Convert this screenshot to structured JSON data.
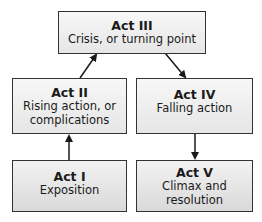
{
  "diagram": {
    "type": "flow",
    "nodes": [
      {
        "id": "act3",
        "title": "Act III",
        "desc": "Crisis, or turning point"
      },
      {
        "id": "act2",
        "title": "Act II",
        "desc": "Rising action, or complications"
      },
      {
        "id": "act4",
        "title": "Act IV",
        "desc": "Falling action"
      },
      {
        "id": "act1",
        "title": "Act I",
        "desc": "Exposition"
      },
      {
        "id": "act5",
        "title": "Act V",
        "desc": "Climax and resolution"
      }
    ],
    "edges": [
      {
        "from": "act1",
        "to": "act2"
      },
      {
        "from": "act2",
        "to": "act3"
      },
      {
        "from": "act3",
        "to": "act4"
      },
      {
        "from": "act4",
        "to": "act5"
      }
    ],
    "colors": {
      "border": "#333333",
      "fill_top": "#f2f2f2",
      "fill_bottom": "#d9d9d9",
      "arrow": "#1a1a1a"
    }
  }
}
